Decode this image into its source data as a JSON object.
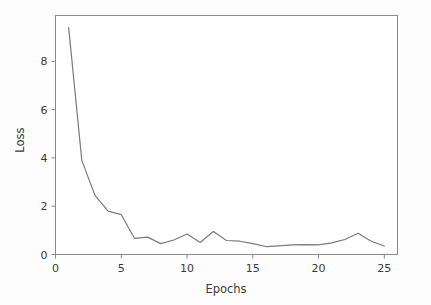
{
  "chart_data": {
    "type": "line",
    "title": "",
    "xlabel": "Epochs",
    "ylabel": "Loss",
    "xlim": [
      0,
      26
    ],
    "ylim": [
      0,
      9.9
    ],
    "grid": false,
    "legend": null,
    "xticks": [
      0,
      5,
      10,
      15,
      20,
      25
    ],
    "xtick_labels": [
      "0",
      "5",
      "10",
      "15",
      "20",
      "25"
    ],
    "yticks": [
      0,
      2,
      4,
      6,
      8
    ],
    "ytick_labels": [
      "0",
      "2",
      "4",
      "6",
      "8"
    ],
    "line_color": "#7a7a7a",
    "line_width": 1.2,
    "x": [
      1,
      2,
      3,
      4,
      5,
      6,
      7,
      8,
      9,
      10,
      11,
      12,
      13,
      14,
      15,
      16,
      17,
      18,
      19,
      20,
      21,
      22,
      23,
      24,
      25
    ],
    "series": [
      {
        "name": "Loss",
        "values": [
          9.4,
          3.9,
          2.45,
          1.8,
          1.65,
          0.67,
          0.72,
          0.45,
          0.6,
          0.85,
          0.5,
          0.95,
          0.58,
          0.55,
          0.45,
          0.33,
          0.36,
          0.4,
          0.41,
          0.4,
          0.48,
          0.62,
          0.88,
          0.55,
          0.35
        ]
      }
    ]
  },
  "axes": {
    "xlabel": "Epochs",
    "ylabel": "Loss"
  }
}
